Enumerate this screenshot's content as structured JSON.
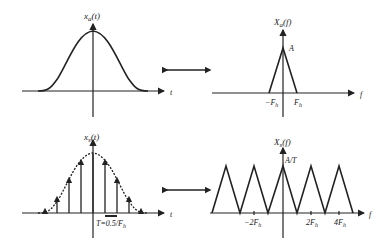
{
  "top_left": {
    "title": "x_a(t)",
    "title_main": "x",
    "title_sub": "a",
    "title_arg": "(t)",
    "axis_label": "t"
  },
  "top_right": {
    "title_main": "X",
    "title_sub": "a",
    "title_arg": "(f)",
    "peak_label": "A",
    "tick_neg": "−F",
    "tick_neg_sub": "h",
    "tick_pos": "F",
    "tick_pos_sub": "h",
    "axis_label": "f"
  },
  "bottom_left": {
    "title_main": "x",
    "title_sub": "s",
    "title_arg": "(t)",
    "axis_label": "t",
    "period_label": "T=0.5/F",
    "period_sub": "h"
  },
  "bottom_right": {
    "title_main": "X",
    "title_sub": "s",
    "title_arg": "(f)",
    "peak_label": "A/T",
    "tick_m2": "−2F",
    "tick_m2_sub": "h",
    "tick_p2": "2F",
    "tick_p2_sub": "h",
    "tick_p4": "4F",
    "tick_p4_sub": "h",
    "axis_label": "f"
  },
  "arrows": {
    "top": "transform-pair",
    "bottom": "transform-pair"
  }
}
